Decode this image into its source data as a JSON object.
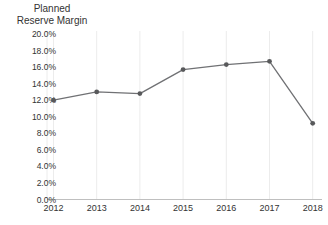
{
  "chart_data": {
    "type": "line",
    "title": "Planned Reserve Margin",
    "y_axis_title_lines": [
      "Planned",
      "Reserve Margin"
    ],
    "xlabel": "",
    "ylabel": "Planned Reserve Margin",
    "categories": [
      "2012",
      "2013",
      "2014",
      "2015",
      "2016",
      "2017",
      "2018"
    ],
    "series": [
      {
        "name": "Planned Reserve Margin",
        "values": [
          12.0,
          13.0,
          12.8,
          15.7,
          16.3,
          16.7,
          9.2
        ]
      }
    ],
    "ylim": [
      0,
      20
    ],
    "y_tick_step": 2,
    "y_tick_labels": [
      "0.0%",
      "2.0%",
      "4.0%",
      "6.0%",
      "8.0%",
      "10.0%",
      "12.0%",
      "14.0%",
      "16.0%",
      "18.0%",
      "20.0%"
    ],
    "grid": "vertical-only",
    "legend": "none",
    "marker": "circle",
    "colors": {
      "line": "#707174",
      "marker": "#58595b",
      "axis": "#bfbfbf",
      "gridline": "#ececec",
      "text": "#333333",
      "background": "#ffffff"
    }
  }
}
